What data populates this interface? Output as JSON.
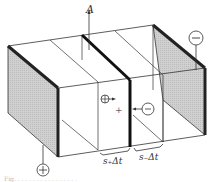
{
  "figure": {
    "labels": {
      "area": "A",
      "positive_terminal": "+",
      "negative_terminal": "−",
      "positive_ion": "+",
      "negative_ion": "−",
      "center_mark": "+",
      "positive_distance": "s₊Δt",
      "negative_distance": "s₋Δt"
    },
    "caption": "Fig. . . . . . . . . . . . . . . . ."
  },
  "colors": {
    "line": "#333333",
    "electrode_shade": "#c8c8c8",
    "background": "#ffffff"
  }
}
